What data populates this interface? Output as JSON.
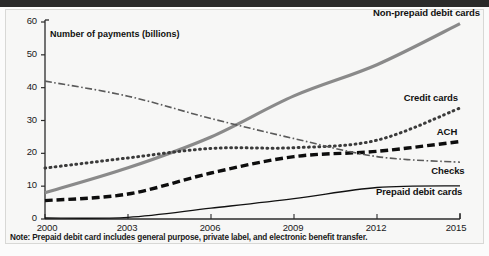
{
  "figure": {
    "background_color": "#f7f7f6",
    "note": "Note: Prepaid debit card includes general purpose, private label, and electronic benefit transfer."
  },
  "chart_data": {
    "type": "line",
    "title": "",
    "subtitle": "",
    "xlabel": "",
    "ylabel": "Number of payments (billions)",
    "xlim": [
      2000,
      2015
    ],
    "ylim": [
      0,
      60
    ],
    "yticks": [
      0,
      10,
      20,
      30,
      40,
      50,
      60
    ],
    "ytick_labels": [
      "0",
      "10",
      "20",
      "30",
      "40",
      "50",
      "60"
    ],
    "xticks": [
      2000,
      2003,
      2006,
      2009,
      2012,
      2015
    ],
    "xtick_labels": [
      "2000",
      "2003",
      "2006",
      "2009",
      "2012",
      "2015"
    ],
    "grid": false,
    "legend_position": "inline-right-labels",
    "x": [
      2000,
      2003,
      2006,
      2009,
      2012,
      2015
    ],
    "series": [
      {
        "name": "Non-prepaid debit cards",
        "label": "Non-prepaid debit cards",
        "color": "#8a8a8a",
        "line_style": "solid",
        "line_width": 3.2,
        "values": [
          8.0,
          15.6,
          25.0,
          37.5,
          47.0,
          59.5
        ],
        "label_x": 2013.1,
        "label_y": 62.5
      },
      {
        "name": "Credit cards",
        "label": "Credit cards",
        "color": "#3a3a3a",
        "line_style": "dotted",
        "line_width": 3.0,
        "values": [
          15.5,
          18.6,
          21.5,
          21.7,
          24.0,
          33.8
        ],
        "label_x": 2013.0,
        "label_y": 36.5
      },
      {
        "name": "ACH",
        "label": "ACH",
        "color": "#0d0d0d",
        "line_style": "dashed",
        "line_width": 3.4,
        "values": [
          5.6,
          7.6,
          14.0,
          19.0,
          20.6,
          23.6
        ],
        "label_x": 2014.2,
        "label_y": 26.2
      },
      {
        "name": "Checks",
        "label": "Checks",
        "color": "#5a5a5a",
        "line_style": "dashdot",
        "line_width": 1.6,
        "values": [
          42.0,
          37.4,
          30.6,
          24.5,
          19.0,
          17.3
        ],
        "label_x": 2014.0,
        "label_y": 14.4
      },
      {
        "name": "Prepaid debit cards",
        "label": "Prepaid debit cards",
        "color": "#111111",
        "line_style": "solid",
        "line_width": 1.3,
        "values": [
          0.3,
          0.5,
          3.3,
          6.2,
          9.6,
          10.1
        ],
        "label_x": 2012.0,
        "label_y": 7.9
      }
    ]
  }
}
